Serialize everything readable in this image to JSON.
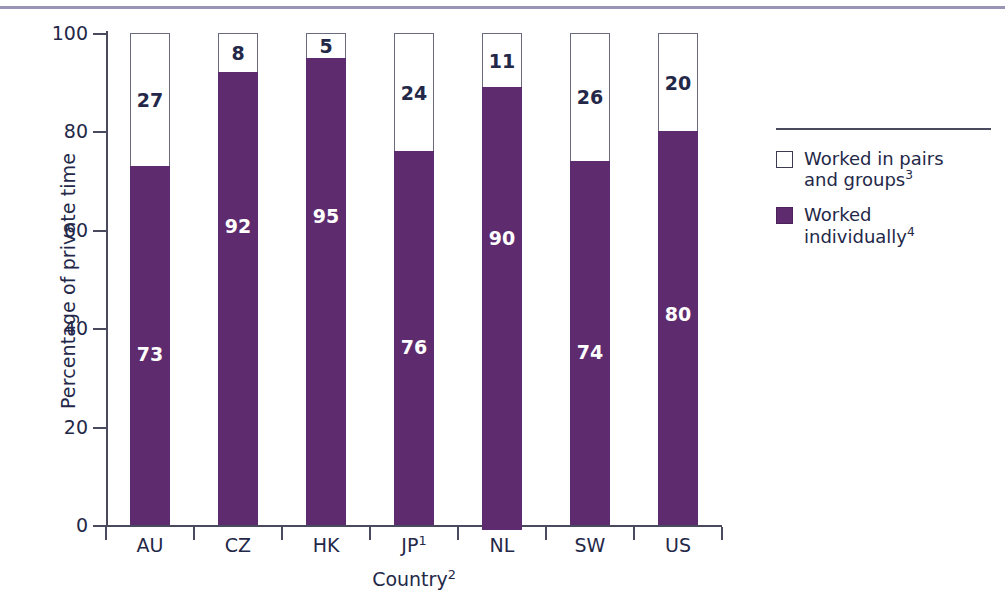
{
  "figure": {
    "top_rule_color": "#9a93b5",
    "background": "#ffffff"
  },
  "axes": {
    "ylabel": "Percentage of private time",
    "xlabel_text": "Country",
    "xlabel_superscript": "2",
    "ytick_labels": [
      "0",
      "20",
      "40",
      "60",
      "80",
      "100"
    ]
  },
  "legend": {
    "items": [
      {
        "swatch": "white",
        "line1": "Worked in pairs",
        "line2": "and groups",
        "superscript": "3"
      },
      {
        "swatch": "purple",
        "line1": "Worked",
        "line2": "individually",
        "superscript": "4"
      }
    ]
  },
  "categories_display": [
    {
      "label": "AU",
      "superscript": ""
    },
    {
      "label": "CZ",
      "superscript": ""
    },
    {
      "label": "HK",
      "superscript": ""
    },
    {
      "label": "JP",
      "superscript": "1"
    },
    {
      "label": "NL",
      "superscript": ""
    },
    {
      "label": "SW",
      "superscript": ""
    },
    {
      "label": "US",
      "superscript": ""
    }
  ],
  "colors": {
    "purple": "#5e2b6e",
    "white": "#ffffff",
    "text": "#242848",
    "axis": "#4a4a5e",
    "bar_outline": "#6b6b80"
  },
  "chart_data": {
    "type": "bar",
    "title": "",
    "subtitle": "",
    "stacked": true,
    "categories": [
      "AU",
      "CZ",
      "HK",
      "JP1",
      "NL",
      "SW",
      "US"
    ],
    "series": [
      {
        "name": "Worked individually4",
        "color": "#5e2b6e",
        "values": [
          73,
          92,
          95,
          76,
          90,
          74,
          80
        ]
      },
      {
        "name": "Worked in pairs and groups3",
        "color": "#ffffff",
        "values": [
          27,
          8,
          5,
          24,
          11,
          26,
          20
        ]
      }
    ],
    "xlabel": "Country2",
    "ylabel": "Percentage of private time",
    "ylim": [
      0,
      100
    ],
    "yticks": [
      0,
      20,
      40,
      60,
      80,
      100
    ],
    "grid": false,
    "legend_position": "right",
    "data_labels": true,
    "annotations": [
      "1 superscript on JP category label",
      "2 superscript on Country axis label",
      "3 superscript on Worked in pairs and groups legend entry",
      "4 superscript on Worked individually legend entry"
    ]
  }
}
